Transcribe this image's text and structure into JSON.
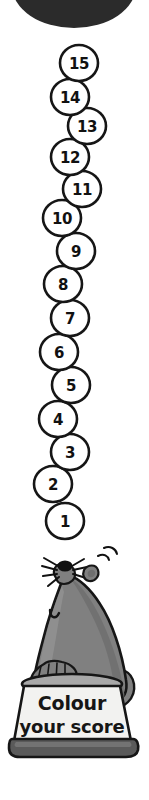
{
  "page": {
    "title": "Colour your score",
    "width": 149,
    "height": 800,
    "background": "#ffffff"
  },
  "colors": {
    "ink": "#111111",
    "outline": "#161616",
    "top_blob": "#2b2b2b",
    "seal_body": "#808080",
    "seal_shadow": "#6e6e6e",
    "seal_light": "#9a9a9a",
    "pedestal_face": "#f2f2f0",
    "pedestal_top": "#a8a8a8",
    "pedestal_base": "#5a5a5a",
    "circle_fill": "#ffffff",
    "text": "#161616"
  },
  "top_blob": {
    "label": "decorative-dark-ellipse",
    "cx": 74,
    "cy": -14,
    "rx": 62,
    "ry": 42
  },
  "score_ladder": {
    "label": "Colour your score ladder",
    "count": 15,
    "circles": [
      {
        "value": "15",
        "cx": 79,
        "cy": 63,
        "r": 19
      },
      {
        "value": "14",
        "cx": 70,
        "cy": 97,
        "r": 19
      },
      {
        "value": "13",
        "cx": 87,
        "cy": 126,
        "r": 19
      },
      {
        "value": "12",
        "cx": 70,
        "cy": 157,
        "r": 19
      },
      {
        "value": "11",
        "cx": 82,
        "cy": 189,
        "r": 19
      },
      {
        "value": "10",
        "cx": 62,
        "cy": 218,
        "r": 19
      },
      {
        "value": "9",
        "cx": 76,
        "cy": 251,
        "r": 19
      },
      {
        "value": "8",
        "cx": 63,
        "cy": 284,
        "r": 19
      },
      {
        "value": "7",
        "cx": 70,
        "cy": 318,
        "r": 19
      },
      {
        "value": "6",
        "cx": 59,
        "cy": 352,
        "r": 19
      },
      {
        "value": "5",
        "cx": 71,
        "cy": 385,
        "r": 19
      },
      {
        "value": "4",
        "cx": 58,
        "cy": 419,
        "r": 19
      },
      {
        "value": "3",
        "cx": 70,
        "cy": 452,
        "r": 19
      },
      {
        "value": "2",
        "cx": 53,
        "cy": 484,
        "r": 19
      },
      {
        "value": "1",
        "cx": 65,
        "cy": 521,
        "r": 19
      }
    ]
  },
  "seal": {
    "label": "cartoon-seal-balancing-ball",
    "ear_label": "seal-ear",
    "eye_label": "seal-closed-eye",
    "whiskers_label": "seal-whiskers",
    "nose_label": "seal-nose"
  },
  "pedestal": {
    "label": "pedestal",
    "line1": "Colour",
    "line2": "your score",
    "line1_size": 19,
    "line2_size": 18
  }
}
